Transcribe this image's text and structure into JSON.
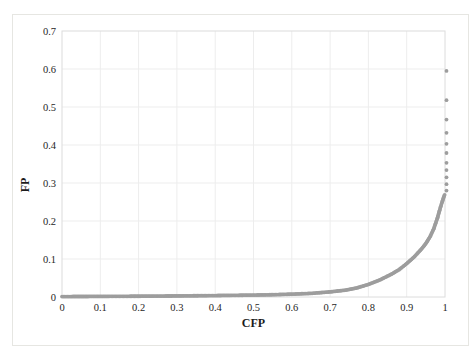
{
  "figure": {
    "background_color": "#ffffff",
    "outer_border_color": "#e6e6e2"
  },
  "chart_data": {
    "type": "scatter",
    "title": "",
    "xlabel": "CFP",
    "ylabel": "FP",
    "xlim": [
      0,
      1
    ],
    "ylim": [
      0,
      0.7
    ],
    "grid": true,
    "legend": "none",
    "marker_color": "#9d9d9d",
    "gridline_color": "#ededed",
    "frame_color": "#dcdcdc",
    "tick_text_color": "#262626",
    "xtick_values": [
      0,
      0.1,
      0.2,
      0.3,
      0.4,
      0.5,
      0.6,
      0.7,
      0.8,
      0.9,
      1
    ],
    "xtick_labels": [
      "0",
      "0.1",
      "0.2",
      "0.3",
      "0.4",
      "0.5",
      "0.6",
      "0.7",
      "0.8",
      "0.9",
      "1"
    ],
    "ytick_values": [
      0,
      0.1,
      0.2,
      0.3,
      0.4,
      0.5,
      0.6,
      0.7
    ],
    "ytick_labels": [
      "0",
      "0.1",
      "0.2",
      "0.3",
      "0.4",
      "0.5",
      "0.6",
      "0.7"
    ],
    "series": [
      {
        "name": "FP vs CFP",
        "curve_points": [
          [
            0,
            0.0012
          ],
          [
            0.05,
            0.0013
          ],
          [
            0.1,
            0.0015
          ],
          [
            0.15,
            0.0018
          ],
          [
            0.2,
            0.002
          ],
          [
            0.25,
            0.0024
          ],
          [
            0.3,
            0.0028
          ],
          [
            0.35,
            0.0033
          ],
          [
            0.4,
            0.0038
          ],
          [
            0.45,
            0.0044
          ],
          [
            0.5,
            0.005
          ],
          [
            0.55,
            0.006
          ],
          [
            0.6,
            0.0075
          ],
          [
            0.65,
            0.0095
          ],
          [
            0.7,
            0.0135
          ],
          [
            0.74,
            0.018
          ],
          [
            0.77,
            0.024
          ],
          [
            0.8,
            0.033
          ],
          [
            0.83,
            0.045
          ],
          [
            0.86,
            0.06
          ],
          [
            0.88,
            0.072
          ],
          [
            0.9,
            0.088
          ],
          [
            0.92,
            0.106
          ],
          [
            0.94,
            0.128
          ],
          [
            0.95,
            0.141
          ],
          [
            0.96,
            0.157
          ],
          [
            0.97,
            0.178
          ],
          [
            0.98,
            0.207
          ],
          [
            0.985,
            0.225
          ],
          [
            0.99,
            0.242
          ],
          [
            0.995,
            0.258
          ],
          [
            0.999,
            0.269
          ]
        ],
        "discrete_points": [
          [
            1,
            0.28
          ],
          [
            1,
            0.297
          ],
          [
            1,
            0.315
          ],
          [
            1,
            0.334
          ],
          [
            1,
            0.353
          ],
          [
            1,
            0.379
          ],
          [
            1,
            0.403
          ],
          [
            1,
            0.432
          ],
          [
            1,
            0.467
          ],
          [
            1,
            0.518
          ],
          [
            1,
            0.595
          ]
        ]
      }
    ]
  }
}
